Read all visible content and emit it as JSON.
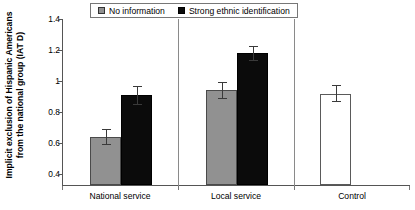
{
  "chart_data": {
    "type": "bar",
    "title": "",
    "subtitle": "",
    "xlabel": "",
    "ylabel": "Implicit exclusion of Hispanic Americans from the national group (IAT D)",
    "ylabel_lines": [
      "Implicit exclusion of Hispanic Americans",
      "from the national group (IAT D)"
    ],
    "categories": [
      "National service",
      "Local service",
      "Control"
    ],
    "yticks": [
      0.4,
      0.6,
      0.8,
      1.0,
      1.2,
      1.4
    ],
    "ytick_labels": [
      "0.4",
      "0.6",
      "0.8",
      "1",
      "1.2",
      "1.4"
    ],
    "ylim": [
      0.4,
      1.4
    ],
    "grid": false,
    "legend_position": "top-center",
    "series": [
      {
        "name": "No information",
        "color": "#919191",
        "values": [
          0.69,
          0.97,
          null
        ],
        "errors": [
          0.05,
          0.05,
          null
        ]
      },
      {
        "name": "Strong ethnic identification",
        "color": "#0b0b0b",
        "values": [
          0.94,
          1.195,
          null
        ],
        "errors": [
          0.055,
          0.045,
          null
        ]
      },
      {
        "name": "Control",
        "color": "#ffffff",
        "in_legend": false,
        "values": [
          null,
          null,
          0.95
        ],
        "errors": [
          null,
          null,
          0.05
        ]
      }
    ],
    "bars": [
      {
        "group": "National service",
        "series": "No information",
        "value": 0.69,
        "error": 0.05,
        "fill": "gray"
      },
      {
        "group": "National service",
        "series": "Strong ethnic identification",
        "value": 0.94,
        "error": 0.055,
        "fill": "black"
      },
      {
        "group": "Local service",
        "series": "No information",
        "value": 0.97,
        "error": 0.05,
        "fill": "gray"
      },
      {
        "group": "Local service",
        "series": "Strong ethnic identification",
        "value": 1.195,
        "error": 0.045,
        "fill": "black"
      },
      {
        "group": "Control",
        "series": "Control",
        "value": 0.95,
        "error": 0.05,
        "fill": "white"
      }
    ]
  },
  "legend": {
    "items": [
      {
        "label": "No information",
        "swatch": "gray-square-icon"
      },
      {
        "label": "Strong ethnic identification",
        "swatch": "black-square-icon"
      }
    ]
  },
  "axes": {
    "y": {
      "title_line1": "Implicit exclusion of Hispanic Americans",
      "title_line2": "from the national group (IAT D)",
      "tick_labels": [
        "1.4",
        "1.2",
        "1",
        "0.8",
        "0.6",
        "0.4"
      ]
    },
    "x": {
      "tick_labels": [
        "National service",
        "Local service",
        "Control"
      ]
    }
  },
  "colors": {
    "gray_bar": "#919191",
    "black_bar": "#0b0b0b",
    "white_bar": "#ffffff",
    "axis": "#555555",
    "error_bar": "#3a3a3a",
    "background": "#ffffff"
  }
}
